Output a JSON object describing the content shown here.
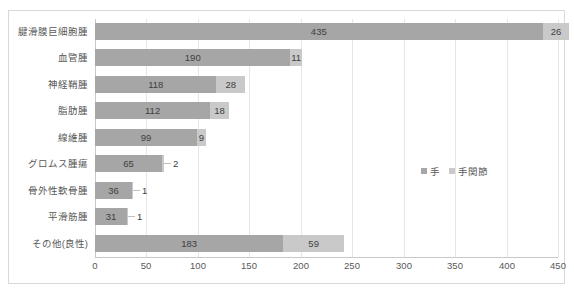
{
  "chart_data": {
    "type": "bar",
    "orientation": "horizontal",
    "stacked": true,
    "title": "",
    "xlabel": "",
    "ylabel": "",
    "xlim": [
      0,
      450
    ],
    "xticks": [
      0,
      50,
      100,
      150,
      200,
      250,
      300,
      350,
      400,
      450
    ],
    "grid": true,
    "legend_position": "middle-right",
    "categories": [
      "腱滑膜巨細胞腫",
      "血管腫",
      "神経鞘腫",
      "脂肪腫",
      "線維腫",
      "グロムス腫瘍",
      "骨外性軟骨腫",
      "平滑筋腫",
      "その他(良性)"
    ],
    "series": [
      {
        "name": "手",
        "color": "#a6a6a6",
        "values": [
          435,
          190,
          118,
          112,
          99,
          65,
          36,
          31,
          183
        ]
      },
      {
        "name": "手関節",
        "color": "#c9c9c9",
        "values": [
          26,
          11,
          28,
          18,
          9,
          2,
          1,
          1,
          59
        ]
      }
    ],
    "label_placement": [
      [
        "inside",
        "inside"
      ],
      [
        "inside",
        "inside"
      ],
      [
        "inside",
        "inside"
      ],
      [
        "inside",
        "inside"
      ],
      [
        "inside",
        "inside"
      ],
      [
        "inside",
        "outside"
      ],
      [
        "inside",
        "outside"
      ],
      [
        "inside",
        "outside"
      ],
      [
        "inside",
        "inside"
      ]
    ]
  },
  "legend": {
    "items": [
      {
        "label": "手",
        "color": "#a6a6a6"
      },
      {
        "label": "手関節",
        "color": "#c9c9c9"
      }
    ]
  },
  "axis": {
    "tick_labels": [
      "0",
      "50",
      "100",
      "150",
      "200",
      "250",
      "300",
      "350",
      "400",
      "450"
    ]
  },
  "colors": {
    "series1": "#a6a6a6",
    "series2": "#c9c9c9",
    "gridline": "#e6e6e6",
    "axis": "#c9c9c9",
    "text": "#595959",
    "border": "#d9d9d9"
  }
}
